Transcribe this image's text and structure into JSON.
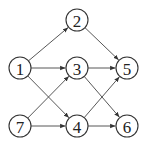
{
  "diagram": {
    "type": "directed-graph",
    "nodes": [
      {
        "id": "1",
        "label": "1",
        "x": 20,
        "y": 68
      },
      {
        "id": "2",
        "label": "2",
        "x": 77,
        "y": 20
      },
      {
        "id": "3",
        "label": "3",
        "x": 77,
        "y": 68
      },
      {
        "id": "4",
        "label": "4",
        "x": 77,
        "y": 126
      },
      {
        "id": "5",
        "label": "5",
        "x": 127,
        "y": 68
      },
      {
        "id": "6",
        "label": "6",
        "x": 127,
        "y": 126
      },
      {
        "id": "7",
        "label": "7",
        "x": 20,
        "y": 126
      }
    ],
    "edges": [
      {
        "from": "1",
        "to": "2"
      },
      {
        "from": "1",
        "to": "3"
      },
      {
        "from": "1",
        "to": "4"
      },
      {
        "from": "2",
        "to": "5"
      },
      {
        "from": "3",
        "to": "5"
      },
      {
        "from": "3",
        "to": "6"
      },
      {
        "from": "7",
        "to": "3"
      },
      {
        "from": "7",
        "to": "4"
      },
      {
        "from": "4",
        "to": "5"
      },
      {
        "from": "4",
        "to": "6"
      }
    ],
    "node_radius": 11
  }
}
